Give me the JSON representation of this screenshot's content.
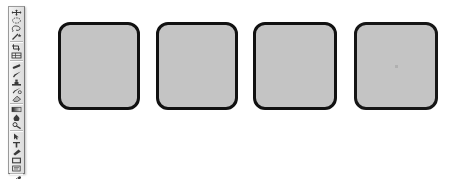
{
  "app": {
    "type": "image-editor",
    "canvas_background": "#ffffff",
    "width": 450,
    "height": 179
  },
  "toolbar": {
    "name": "tools-palette",
    "orientation": "vertical",
    "position": "left",
    "background": "#e9e9e9",
    "border_color": "#9a9a9a",
    "tools": [
      {
        "name": "move-tool",
        "icon": "move-icon"
      },
      {
        "name": "marquee-tool",
        "icon": "marquee-ellipse-icon"
      },
      {
        "name": "lasso-tool",
        "icon": "lasso-icon"
      },
      {
        "name": "magic-wand-tool",
        "icon": "magic-wand-icon"
      },
      {
        "name": "crop-tool",
        "icon": "crop-icon"
      },
      {
        "name": "slice-tool",
        "icon": "slice-icon"
      },
      {
        "name": "healing-brush-tool",
        "icon": "healing-brush-icon"
      },
      {
        "name": "brush-tool",
        "icon": "paintbrush-icon"
      },
      {
        "name": "stamp-tool",
        "icon": "clone-stamp-icon"
      },
      {
        "name": "history-brush-tool",
        "icon": "history-brush-icon"
      },
      {
        "name": "eraser-tool",
        "icon": "eraser-icon"
      },
      {
        "name": "gradient-tool",
        "icon": "gradient-icon"
      },
      {
        "name": "blur-tool",
        "icon": "blur-drop-icon"
      },
      {
        "name": "dodge-tool",
        "icon": "dodge-icon"
      },
      {
        "name": "path-selection-tool",
        "icon": "path-arrow-icon"
      },
      {
        "name": "type-tool",
        "icon": "text-t-icon"
      },
      {
        "name": "pen-tool",
        "icon": "pen-icon"
      },
      {
        "name": "shape-tool",
        "icon": "rectangle-icon"
      },
      {
        "name": "notes-tool",
        "icon": "note-icon"
      },
      {
        "name": "eyedropper-tool",
        "icon": "eyedropper-icon"
      },
      {
        "name": "hand-tool",
        "icon": "hand-icon"
      },
      {
        "name": "zoom-tool",
        "icon": "magnifier-icon"
      }
    ],
    "color_swatches": {
      "foreground": "#1a1a1a",
      "background": "#ffffff"
    }
  },
  "document": {
    "name": "shape-canvas",
    "shapes": [
      {
        "label": "rounded-square-1",
        "fill": "#c4c4c4",
        "stroke": "#111111",
        "stroke_width": 3,
        "corner_radius": 12,
        "x": 58,
        "y": 22,
        "width": 82,
        "height": 88,
        "has_center_mark": false
      },
      {
        "label": "rounded-square-2",
        "fill": "#c4c4c4",
        "stroke": "#111111",
        "stroke_width": 3,
        "corner_radius": 12,
        "x": 156,
        "y": 22,
        "width": 82,
        "height": 88,
        "has_center_mark": false
      },
      {
        "label": "rounded-square-3",
        "fill": "#c4c4c4",
        "stroke": "#111111",
        "stroke_width": 3,
        "corner_radius": 12,
        "x": 253,
        "y": 22,
        "width": 84,
        "height": 88,
        "has_center_mark": false
      },
      {
        "label": "rounded-square-4",
        "fill": "#c4c4c4",
        "stroke": "#161616",
        "stroke_width": 3,
        "corner_radius": 12,
        "x": 354,
        "y": 22,
        "width": 84,
        "height": 88,
        "has_center_mark": true
      }
    ]
  }
}
